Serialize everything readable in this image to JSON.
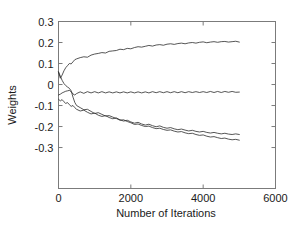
{
  "chart_data": {
    "type": "line",
    "title": "",
    "xlabel": "Number of Iterations",
    "ylabel": "Weights",
    "xlim": [
      0,
      6000
    ],
    "ylim": [
      -0.495,
      0.3
    ],
    "xticks": [
      0,
      2000,
      4000,
      6000
    ],
    "xtick_labels": [
      "0",
      "2000",
      "4000",
      "6000"
    ],
    "yticks": [
      -0.3,
      -0.2,
      -0.1,
      0,
      0.1,
      0.2,
      0.3
    ],
    "ytick_labels": [
      "-0.3",
      "-0.2",
      "-0.1",
      "0",
      "0.1",
      "0.2",
      "0.3"
    ],
    "grid": false,
    "legend": null,
    "legend_position": "none",
    "line_color": "#2b2b2b",
    "frame_color": "#7b7b7b",
    "x": [
      0,
      50,
      100,
      150,
      200,
      250,
      300,
      350,
      400,
      450,
      500,
      600,
      700,
      800,
      900,
      1000,
      1100,
      1200,
      1300,
      1400,
      1500,
      1600,
      1700,
      1800,
      1900,
      2000,
      2100,
      2200,
      2300,
      2400,
      2500,
      2600,
      2700,
      2800,
      2900,
      3000,
      3100,
      3200,
      3300,
      3400,
      3500,
      3600,
      3700,
      3800,
      3900,
      4000,
      4100,
      4200,
      4300,
      4400,
      4500,
      4600,
      4700,
      4800,
      4900,
      5000
    ],
    "series": [
      {
        "name": "weight-1",
        "values": [
          0.06,
          0.03,
          0.045,
          0.065,
          0.08,
          0.09,
          0.1,
          0.098,
          0.108,
          0.118,
          0.122,
          0.128,
          0.132,
          0.13,
          0.14,
          0.145,
          0.148,
          0.152,
          0.15,
          0.158,
          0.16,
          0.162,
          0.168,
          0.166,
          0.172,
          0.17,
          0.176,
          0.18,
          0.178,
          0.182,
          0.186,
          0.183,
          0.188,
          0.19,
          0.187,
          0.192,
          0.194,
          0.191,
          0.195,
          0.197,
          0.194,
          0.198,
          0.2,
          0.197,
          0.201,
          0.203,
          0.199,
          0.202,
          0.204,
          0.201,
          0.204,
          0.205,
          0.202,
          0.204,
          0.206,
          0.202
        ]
      },
      {
        "name": "weight-2",
        "values": [
          -0.05,
          -0.046,
          -0.04,
          -0.036,
          -0.032,
          -0.03,
          -0.028,
          -0.034,
          -0.045,
          -0.05,
          -0.043,
          -0.035,
          -0.042,
          -0.034,
          -0.04,
          -0.034,
          -0.04,
          -0.034,
          -0.04,
          -0.035,
          -0.04,
          -0.035,
          -0.04,
          -0.035,
          -0.04,
          -0.035,
          -0.04,
          -0.035,
          -0.04,
          -0.035,
          -0.04,
          -0.034,
          -0.039,
          -0.034,
          -0.039,
          -0.034,
          -0.039,
          -0.034,
          -0.039,
          -0.034,
          -0.039,
          -0.034,
          -0.038,
          -0.034,
          -0.038,
          -0.034,
          -0.038,
          -0.033,
          -0.038,
          -0.033,
          -0.038,
          -0.033,
          -0.037,
          -0.033,
          -0.037,
          -0.036
        ]
      },
      {
        "name": "weight-3",
        "values": [
          0.06,
          0.04,
          0.02,
          0.005,
          -0.005,
          -0.012,
          -0.018,
          -0.03,
          -0.06,
          -0.085,
          -0.1,
          -0.11,
          -0.12,
          -0.118,
          -0.128,
          -0.138,
          -0.134,
          -0.142,
          -0.15,
          -0.148,
          -0.155,
          -0.162,
          -0.17,
          -0.168,
          -0.176,
          -0.182,
          -0.19,
          -0.188,
          -0.195,
          -0.2,
          -0.198,
          -0.205,
          -0.21,
          -0.208,
          -0.214,
          -0.218,
          -0.216,
          -0.222,
          -0.226,
          -0.224,
          -0.23,
          -0.234,
          -0.232,
          -0.238,
          -0.242,
          -0.24,
          -0.246,
          -0.25,
          -0.248,
          -0.253,
          -0.257,
          -0.255,
          -0.26,
          -0.263,
          -0.261,
          -0.265
        ]
      },
      {
        "name": "weight-4",
        "values": [
          -0.07,
          -0.078,
          -0.072,
          -0.082,
          -0.09,
          -0.086,
          -0.096,
          -0.104,
          -0.1,
          -0.11,
          -0.118,
          -0.126,
          -0.122,
          -0.132,
          -0.14,
          -0.136,
          -0.146,
          -0.152,
          -0.148,
          -0.157,
          -0.163,
          -0.159,
          -0.168,
          -0.174,
          -0.17,
          -0.178,
          -0.184,
          -0.18,
          -0.188,
          -0.193,
          -0.189,
          -0.196,
          -0.201,
          -0.197,
          -0.204,
          -0.208,
          -0.205,
          -0.211,
          -0.215,
          -0.212,
          -0.217,
          -0.221,
          -0.218,
          -0.223,
          -0.226,
          -0.223,
          -0.228,
          -0.231,
          -0.228,
          -0.232,
          -0.235,
          -0.232,
          -0.236,
          -0.238,
          -0.235,
          -0.238
        ]
      }
    ]
  }
}
